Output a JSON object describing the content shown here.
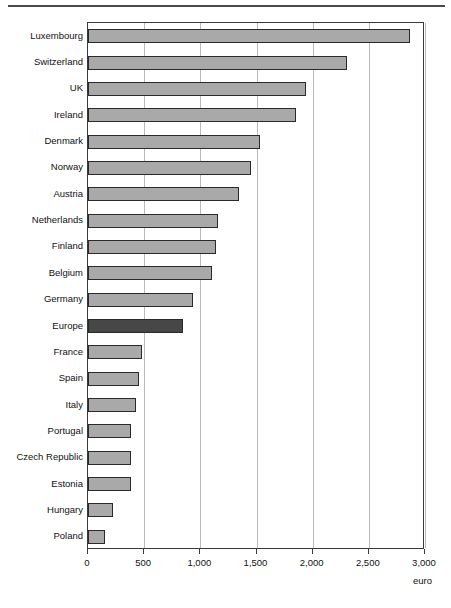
{
  "figure": {
    "has_top_rule": true,
    "background": "#ffffff"
  },
  "chart_data": {
    "type": "bar",
    "orientation": "horizontal",
    "title": "",
    "subtitle": "",
    "xlabel": "euro",
    "ylabel": "",
    "xlim": [
      0,
      3000
    ],
    "xticks": [
      0,
      500,
      1000,
      1500,
      2000,
      2500,
      3000
    ],
    "xtick_labels": [
      "0",
      "500",
      "1,000",
      "1,500",
      "2,000",
      "2,500",
      "3,000"
    ],
    "grid": "vertical",
    "legend": "none",
    "bar_color": "#a9a9a9",
    "bar_edge_color": "#2a2a2a",
    "highlight_color": "#474747",
    "highlight_category": "Europe",
    "categories": [
      "Luxembourg",
      "Switzerland",
      "UK",
      "Ireland",
      "Denmark",
      "Norway",
      "Austria",
      "Netherlands",
      "Finland",
      "Belgium",
      "Germany",
      "Europe",
      "France",
      "Spain",
      "Italy",
      "Portugal",
      "Czech Republic",
      "Estonia",
      "Hungary",
      "Poland"
    ],
    "values": [
      2870,
      2310,
      1940,
      1850,
      1530,
      1450,
      1345,
      1155,
      1140,
      1105,
      935,
      845,
      485,
      455,
      430,
      385,
      385,
      380,
      220,
      150
    ]
  }
}
